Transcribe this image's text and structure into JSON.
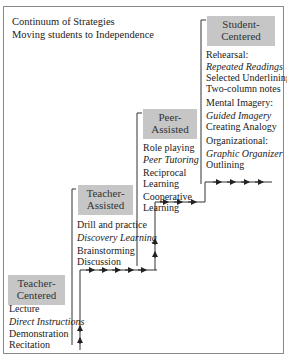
{
  "diagram": {
    "title_line1": "Continuum of Strategies",
    "title_line2": "Moving students to Independence",
    "levels": [
      {
        "name": "Teacher-Centered",
        "label_line1": "Teacher-",
        "label_line2": "Centered",
        "items": [
          "Lecture",
          "Direct Instructions",
          "Demonstration",
          "Recitation"
        ],
        "italic_items": [
          "Direct Instructions"
        ]
      },
      {
        "name": "Teacher-Assisted",
        "label_line1": "Teacher-",
        "label_line2": "Assisted",
        "items": [
          "Drill and practice",
          "Discovery Learning",
          "Brainstorming",
          "Discussion"
        ],
        "italic_items": [
          "Discovery Learning"
        ]
      },
      {
        "name": "Peer-Assisted",
        "label_line1": "Peer-",
        "label_line2": "Assisted",
        "items": [
          "Role playing",
          "Peer Tutoring",
          "Reciprocal",
          "Learning",
          "Cooperative",
          "Learning"
        ],
        "italic_items": [
          "Peer Tutoring"
        ]
      },
      {
        "name": "Student-Centered",
        "label_line1": "Student-",
        "label_line2": "Centered",
        "items": [
          "Rehearsal:",
          "Repeated Readings",
          "Selected Underlining",
          "Two-column notes",
          "Mental Imagery:",
          "Guided Imagery",
          "Creating Analogy",
          "Organizational:",
          "Graphic Organizer",
          "Outlining"
        ],
        "italic_items": [
          "Repeated Readings",
          "Guided Imagery",
          "Graphic Organizer"
        ]
      }
    ],
    "colors": {
      "box_fill": "#c6c6c6",
      "frame": "#8a8a8a",
      "lines": "#333333"
    },
    "icons": {
      "arrow_right": "→",
      "arrow_up": "↑"
    }
  }
}
